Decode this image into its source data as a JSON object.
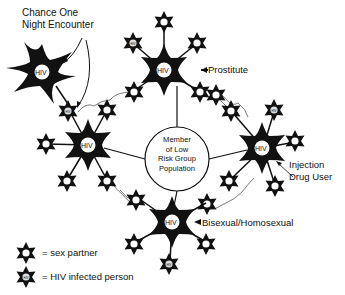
{
  "title_annotation": {
    "line1": "Chance One",
    "line2": "Night Encounter"
  },
  "center": {
    "line1": "Member",
    "line2": "of Low",
    "line3": "Risk Group",
    "line4": "Population"
  },
  "hubs": {
    "top": {
      "label": "Prostitute",
      "badge": "HIV"
    },
    "right": {
      "label_line1": "Injection",
      "label_line2": "Drug User",
      "badge": "HIV"
    },
    "bottom": {
      "label": "Bisexual/Homosexual",
      "badge": "HIV"
    },
    "left": {
      "badge": "HIV"
    },
    "chance": {
      "badge": "HIV"
    }
  },
  "legend": {
    "sex_partner": "= sex partner",
    "hiv_infected": "= HIV infected person"
  },
  "colors": {
    "ink": "#111111",
    "background": "#ffffff"
  }
}
